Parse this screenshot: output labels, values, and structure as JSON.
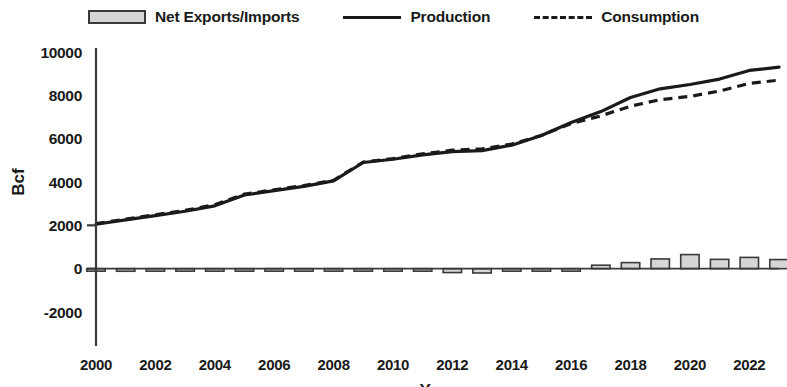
{
  "legend": {
    "items": [
      {
        "label": "Net Exports/Imports",
        "marker": "bar-swatch"
      },
      {
        "label": "Production",
        "marker": "solid-line"
      },
      {
        "label": "Consumption",
        "marker": "dashed-line"
      }
    ]
  },
  "axes": {
    "ylabel": "Bcf",
    "xlabel": "Year",
    "yticks": [
      "10000",
      "8000",
      "6000",
      "4000",
      "2000",
      "0",
      "-2000"
    ],
    "xticks": [
      "2000",
      "2002",
      "2004",
      "2006",
      "2008",
      "2010",
      "2012",
      "2014",
      "2016",
      "2018",
      "2020",
      "2022"
    ]
  },
  "colors": {
    "line": "#1a1a1a",
    "bar_fill": "#d6d6d6",
    "bar_stroke": "#3a3a3a",
    "axis": "#3a3a3a",
    "background": "#ffffff"
  },
  "chart_data": {
    "type": "line",
    "title": "",
    "xlabel": "Year",
    "ylabel": "Bcf",
    "xlim": [
      2000,
      2023
    ],
    "ylim": [
      -2000,
      10000
    ],
    "ytick_step": 2000,
    "grid": false,
    "legend_position": "top",
    "x": [
      2000,
      2001,
      2002,
      2003,
      2004,
      2005,
      2006,
      2007,
      2008,
      2009,
      2010,
      2011,
      2012,
      2013,
      2014,
      2015,
      2016,
      2017,
      2018,
      2019,
      2020,
      2021,
      2022,
      2023
    ],
    "series": [
      {
        "name": "Production",
        "type": "line",
        "style": "solid",
        "values": [
          2050,
          2250,
          2450,
          2650,
          2900,
          3400,
          3600,
          3800,
          4050,
          4900,
          5050,
          5250,
          5400,
          5450,
          5700,
          6150,
          6750,
          7250,
          7900,
          8300,
          8500,
          8750,
          9150,
          9300
        ]
      },
      {
        "name": "Consumption",
        "type": "line",
        "style": "dashed",
        "values": [
          2080,
          2290,
          2490,
          2690,
          2950,
          3440,
          3640,
          3840,
          4080,
          4920,
          5080,
          5300,
          5470,
          5530,
          5750,
          6150,
          6700,
          7050,
          7500,
          7800,
          7950,
          8200,
          8550,
          8700
        ]
      },
      {
        "name": "Net Exports/Imports",
        "type": "bar",
        "values": [
          -30,
          -120,
          -110,
          -40,
          -40,
          -40,
          -40,
          -50,
          -30,
          -20,
          -30,
          -100,
          -180,
          -200,
          -60,
          -30,
          -80,
          160,
          280,
          450,
          650,
          430,
          520,
          420
        ]
      }
    ]
  }
}
